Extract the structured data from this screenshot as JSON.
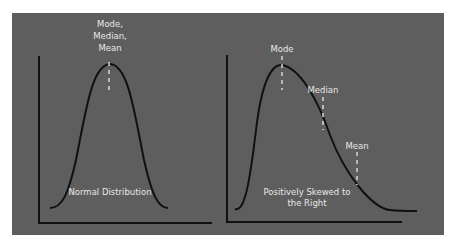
{
  "colors": {
    "background": "#5e5e5e",
    "curve": "#111111",
    "text": "#e8e8e8",
    "marker": "#d9d9d9"
  },
  "left_chart": {
    "peak_label_lines": [
      "Mode,",
      "Median,",
      "Mean"
    ],
    "caption": "Normal Distribution"
  },
  "right_chart": {
    "mode_label": "Mode",
    "median_label": "Median",
    "mean_label": "Mean",
    "caption_lines": [
      "Positively Skewed to",
      "the Right"
    ]
  }
}
